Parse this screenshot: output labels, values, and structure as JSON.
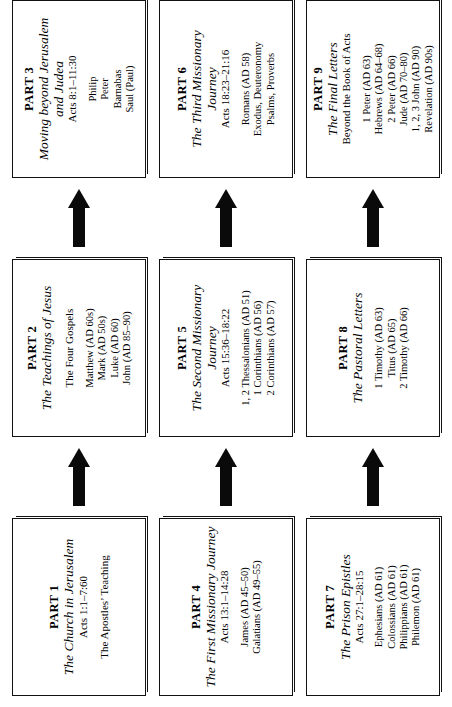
{
  "diagram": {
    "type": "flowchart",
    "orientation": "rotated-90",
    "rows": [
      {
        "id": "row-1",
        "boxes": [
          {
            "part": "PART 1",
            "title": "The Church in Jerusalem",
            "reference": "Acts 1:1–7:60",
            "subtitle": "The Apostles’ Teaching",
            "items": []
          },
          {
            "part": "PART 2",
            "title": "The Teachings of Jesus",
            "reference": "",
            "subtitle": "The Four Gospels",
            "items": [
              "Matthew (AD 60s)",
              "Mark (AD 50s)",
              "Luke (AD 60)",
              "John (AD 85–90)"
            ]
          },
          {
            "part": "PART 3",
            "title": "Moving beyond Jerusalem and Judea",
            "reference": "Acts 8:1–11:30",
            "subtitle": "",
            "items": [
              "Philip",
              "Peter",
              "Barnabas",
              "Saul (Paul)"
            ]
          }
        ]
      },
      {
        "id": "row-2",
        "boxes": [
          {
            "part": "PART 4",
            "title": "The First Missionary Journey",
            "reference": "Acts 13:1–14:28",
            "subtitle": "",
            "items": [
              "James (AD 45–50)",
              "Galatians (AD 49–55)"
            ]
          },
          {
            "part": "PART 5",
            "title": "The Second Missionary Journey",
            "reference": "Acts 15:36–18:22",
            "subtitle": "",
            "items": [
              "1, 2 Thessalonians (AD 51)",
              "1 Corinthians (AD 56)",
              "2 Corinthians (AD 57)"
            ]
          },
          {
            "part": "PART 6",
            "title": "The Third Missionary Journey",
            "reference": "Acts 18:23–21:16",
            "subtitle": "",
            "items": [
              "Romans (AD 58)",
              "Exodus, Deuteronomy",
              "Psalms, Proverbs"
            ]
          }
        ]
      },
      {
        "id": "row-3",
        "boxes": [
          {
            "part": "PART 7",
            "title": "The Prison Epistles",
            "reference": "Acts 27:1–28:15",
            "subtitle": "",
            "items": [
              "Ephesians (AD 61)",
              "Colossians (AD 61)",
              "Philippians (AD 61)",
              "Philemon (AD 61)"
            ]
          },
          {
            "part": "PART 8",
            "title": "The Pastoral Letters",
            "reference": "",
            "subtitle": "",
            "items": [
              "1 Timothy (AD 63)",
              "Titus (AD 65)",
              "2 Timothy (AD 66)"
            ]
          },
          {
            "part": "PART 9",
            "title": "The Final Letters",
            "reference": "Beyond the Book of Acts",
            "subtitle": "",
            "items": [
              "1 Peter (AD 63)",
              "Hebrews (AD 64–68)",
              "2 Peter (AD 66)",
              "Jude (AD 70–80)",
              "1, 2, 3 John (AD 90)",
              "Revelation (AD 90s)"
            ]
          }
        ]
      }
    ],
    "arrow_icon": "right-arrow-icon",
    "colors": {
      "ink": "#111111",
      "arrow": "#0a0a0a",
      "background": "#ffffff"
    }
  }
}
